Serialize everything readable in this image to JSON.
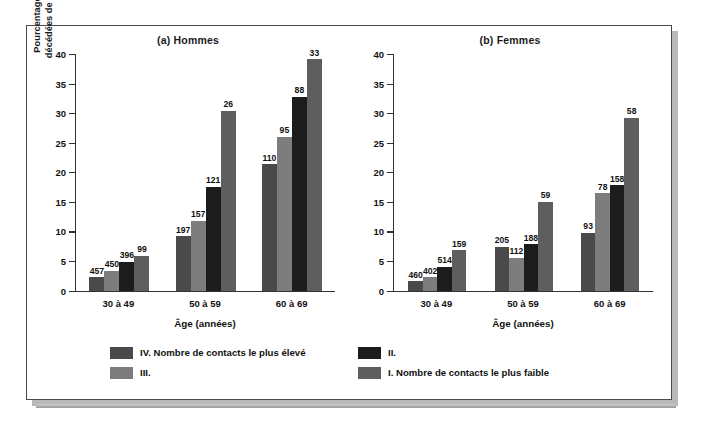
{
  "figure": {
    "ylabel": "Pourcentage de personnes\ndécédées de diverses causes",
    "xlabel_a": "Âge (années)",
    "xlabel_b": "Âge (années)",
    "title_a": "(a) Hommes",
    "title_b": "(b) Femmes"
  },
  "legend": {
    "items": [
      {
        "label": "IV. Nombre de contacts le plus élevé",
        "color": "#4a4a4a",
        "swatch_name": "legend-swatch-iv"
      },
      {
        "label": "III.",
        "color": "#7d7d7d",
        "swatch_name": "legend-swatch-iii"
      },
      {
        "label": "II.",
        "color": "#1c1c1c",
        "swatch_name": "legend-swatch-ii"
      },
      {
        "label": "I. Nombre de contacts le plus faible",
        "color": "#5e5e5e",
        "swatch_name": "legend-swatch-i"
      }
    ]
  },
  "chart_data": [
    {
      "type": "bar",
      "title": "(a) Hommes",
      "xlabel": "Âge (années)",
      "ylabel": "Pourcentage de personnes décédées de diverses causes",
      "categories": [
        "30 à 49",
        "50 à 59",
        "60 à 69"
      ],
      "ylim": [
        0,
        40
      ],
      "yticks": [
        0,
        5,
        10,
        15,
        20,
        25,
        30,
        35,
        40
      ],
      "grid": false,
      "legend_position": "bottom",
      "series": [
        {
          "name": "IV. Nombre de contacts le plus élevé",
          "color": "#4a4a4a",
          "values": [
            2.3,
            9.2,
            21.4
          ],
          "labels": [
            "457",
            "197",
            "110"
          ]
        },
        {
          "name": "III.",
          "color": "#7d7d7d",
          "values": [
            3.4,
            11.8,
            26.0
          ],
          "labels": [
            "450",
            "157",
            "95"
          ]
        },
        {
          "name": "II.",
          "color": "#1c1c1c",
          "values": [
            4.9,
            17.6,
            32.8
          ],
          "labels": [
            "396",
            "121",
            "88"
          ]
        },
        {
          "name": "I. Nombre de contacts le plus faible",
          "color": "#5e5e5e",
          "values": [
            5.9,
            30.4,
            39.1
          ],
          "labels": [
            "99",
            "26",
            "33"
          ]
        }
      ]
    },
    {
      "type": "bar",
      "title": "(b) Femmes",
      "xlabel": "Âge (années)",
      "ylabel": "Pourcentage de personnes décédées de diverses causes",
      "categories": [
        "30 à 49",
        "50 à 59",
        "60 à 69"
      ],
      "ylim": [
        0,
        40
      ],
      "yticks": [
        0,
        5,
        10,
        15,
        20,
        25,
        30,
        35,
        40
      ],
      "grid": false,
      "legend_position": "bottom",
      "series": [
        {
          "name": "IV. Nombre de contacts le plus élevé",
          "color": "#4a4a4a",
          "values": [
            1.6,
            7.4,
            9.8
          ],
          "labels": [
            "460",
            "205",
            "93"
          ]
        },
        {
          "name": "III.",
          "color": "#7d7d7d",
          "values": [
            2.3,
            5.6,
            16.5
          ],
          "labels": [
            "402",
            "112",
            "78"
          ]
        },
        {
          "name": "II.",
          "color": "#1c1c1c",
          "values": [
            4.0,
            7.8,
            17.8
          ],
          "labels": [
            "514",
            "188",
            "158"
          ]
        },
        {
          "name": "I. Nombre de contacts le plus faible",
          "color": "#5e5e5e",
          "values": [
            6.8,
            15.0,
            29.2
          ],
          "labels": [
            "159",
            "59",
            "58"
          ]
        }
      ]
    }
  ]
}
